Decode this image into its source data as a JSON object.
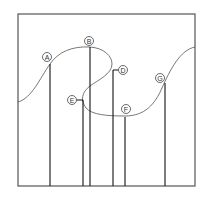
{
  "diagram": {
    "title": "",
    "frame": {
      "x": 18,
      "y": 14,
      "width": 177,
      "height": 172
    },
    "curve_path": "M18,102 C32,98 40,78 50,64 C58,52 72,46 90,47 C104,48 112,56 112,64 C112,74 98,80 90,86 C82,92 80,100 86,108 C92,115 108,116 125,116 C145,116 155,104 162,88 C170,70 180,50 195,47",
    "points": [
      {
        "id": "A",
        "label": "A",
        "line_x": 50,
        "line_top": 64,
        "label_x": 47,
        "label_y": 57,
        "tick": false
      },
      {
        "id": "B",
        "label": "B",
        "line_x": 90,
        "line_top": 47,
        "label_x": 89,
        "label_y": 41,
        "tick": false
      },
      {
        "id": "D",
        "label": "D",
        "line_x": 113,
        "line_top": 70,
        "label_x": 123,
        "label_y": 70,
        "tick": true
      },
      {
        "id": "E",
        "label": "E",
        "line_x": 83,
        "line_top": 100,
        "label_x": 72,
        "label_y": 100,
        "tick": true
      },
      {
        "id": "F",
        "label": "F",
        "line_x": 125,
        "line_top": 117,
        "label_x": 126,
        "label_y": 109,
        "tick": false
      },
      {
        "id": "G",
        "label": "G",
        "line_x": 165,
        "line_top": 83,
        "label_x": 160,
        "label_y": 78,
        "tick": false
      }
    ],
    "baseline_y": 186
  }
}
